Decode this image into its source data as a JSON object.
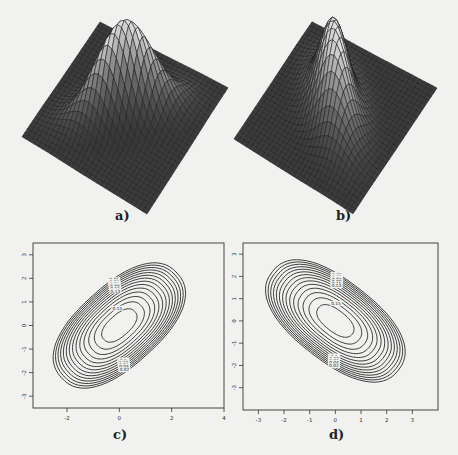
{
  "figure": {
    "panels": [
      {
        "id": "a",
        "caption": "a)",
        "kind": "surface",
        "description": "bivariate normal density surface, positive correlation"
      },
      {
        "id": "b",
        "caption": "b)",
        "kind": "surface",
        "description": "bivariate normal density surface, negative correlation"
      },
      {
        "id": "c",
        "caption": "c)",
        "kind": "contour"
      },
      {
        "id": "d",
        "caption": "d)",
        "kind": "contour"
      }
    ]
  },
  "chart_data": [
    {
      "type": "surface",
      "panel": "a",
      "title": "",
      "caption": "a)",
      "correlation_sign": "positive"
    },
    {
      "type": "surface",
      "panel": "b",
      "title": "",
      "caption": "b)",
      "correlation_sign": "negative"
    },
    {
      "type": "contour",
      "panel": "c",
      "caption": "c)",
      "xticks": [
        -2,
        0,
        2,
        4
      ],
      "yticks": [
        3,
        2,
        1,
        0,
        -1,
        -2,
        -3
      ],
      "xlim": [
        -3.3,
        4
      ],
      "ylim": [
        -3.5,
        3.5
      ],
      "contour_levels": [
        0.01,
        0.03,
        0.05,
        0.07,
        0.09,
        0.11,
        0.13,
        0.15
      ],
      "level_labels_visible": [
        "0.01",
        "0.03",
        "0.05",
        "0.07",
        "0.09",
        "0.11",
        "0.13",
        "0.15",
        "0.1",
        "0.08",
        "0.06",
        "0.04",
        "0.02"
      ],
      "orientation": "positive slope",
      "center": [
        0,
        0
      ]
    },
    {
      "type": "contour",
      "panel": "d",
      "caption": "d)",
      "xticks": [
        -3,
        -2,
        -1,
        0,
        1,
        2,
        3
      ],
      "yticks": [
        3,
        2,
        1,
        0,
        -1,
        -2,
        -3
      ],
      "xlim": [
        -3.6,
        4
      ],
      "ylim": [
        -4,
        3.5
      ],
      "contour_levels": [
        0.01,
        0.03,
        0.05,
        0.07,
        0.09,
        0.11,
        0.13,
        0.15
      ],
      "level_labels_visible": [
        "0.01",
        "0.03",
        "0.05",
        "0.07",
        "0.09",
        "0.11",
        "0.13",
        "0.15",
        "0.1",
        "0.08",
        "0.06",
        "0.04",
        "0.02"
      ],
      "orientation": "negative slope",
      "center": [
        0,
        0
      ]
    }
  ]
}
